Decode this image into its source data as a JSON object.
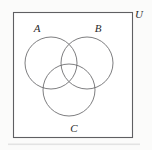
{
  "figure": {
    "kind": "venn-diagram",
    "width": 152,
    "height": 150,
    "background_color": "#fbfbfa",
    "interior_color": "#ffffff",
    "stroke_color": "#6e6e70",
    "frame_stroke_color": "#5f5f62",
    "label_color": "#2b2b2b"
  },
  "universe": {
    "label": "U",
    "label_x": 139,
    "label_y": 18,
    "rect": {
      "x": 13.5,
      "y": 12.5,
      "width": 119,
      "height": 125
    }
  },
  "sets": [
    {
      "id": "A",
      "label": "A",
      "cx": 51,
      "cy": 63,
      "r": 26,
      "label_x": 37,
      "label_y": 32
    },
    {
      "id": "B",
      "label": "B",
      "cx": 87,
      "cy": 63,
      "r": 26,
      "label_x": 98,
      "label_y": 32
    },
    {
      "id": "C",
      "label": "C",
      "cx": 69,
      "cy": 90,
      "r": 26,
      "label_x": 74,
      "label_y": 132
    }
  ]
}
